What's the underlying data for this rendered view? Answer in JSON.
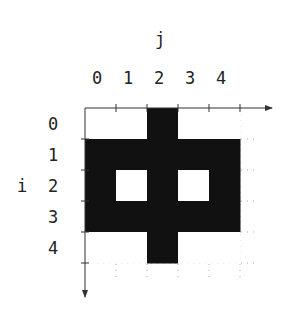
{
  "diagram": {
    "col_axis_label": "j",
    "row_axis_label": "i",
    "col_labels": [
      "0",
      "1",
      "2",
      "3",
      "4"
    ],
    "row_labels": [
      "0",
      "1",
      "2",
      "3",
      "4"
    ],
    "grid": [
      [
        0,
        0,
        1,
        0,
        0
      ],
      [
        1,
        1,
        1,
        1,
        1
      ],
      [
        1,
        0,
        1,
        0,
        1
      ],
      [
        1,
        1,
        1,
        1,
        1
      ],
      [
        0,
        0,
        1,
        0,
        0
      ]
    ],
    "fill_color": "#111111",
    "empty_color": "#ffffff"
  }
}
